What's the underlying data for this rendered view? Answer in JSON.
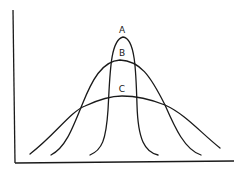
{
  "diagram": {
    "type": "distribution-curves",
    "axes": {
      "x_label": "",
      "y_label": ""
    },
    "curves": [
      {
        "label": "A",
        "shape": "narrow, tall (leptokurtic)"
      },
      {
        "label": "B",
        "shape": "medium (mesokurtic)"
      },
      {
        "label": "C",
        "shape": "wide, flat (platykurtic)"
      }
    ],
    "colors": {
      "line": "#1a1a1a",
      "background": "#ffffff"
    }
  }
}
